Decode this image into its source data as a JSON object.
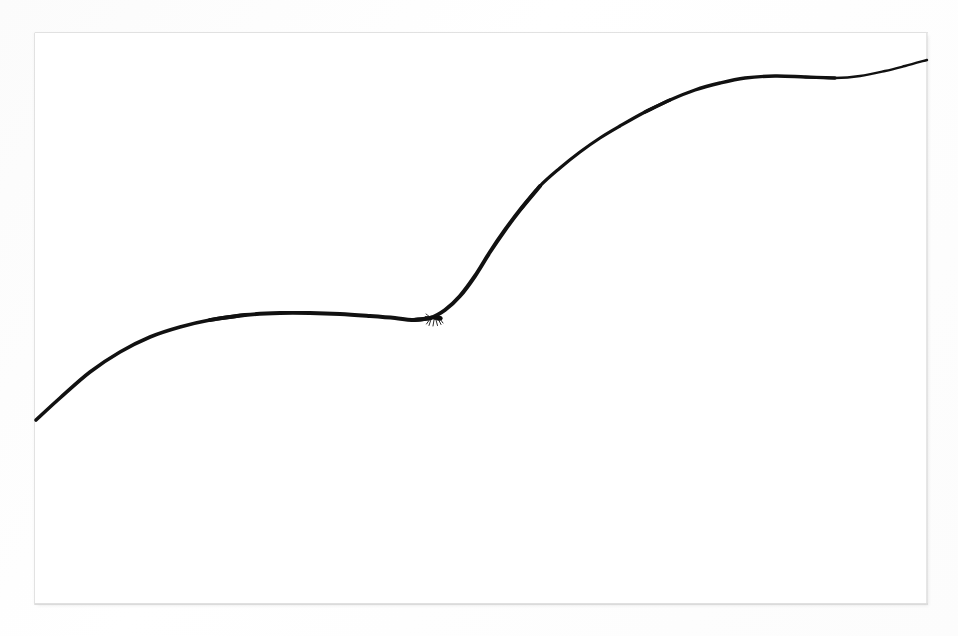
{
  "scene": {
    "title": "Hand-drawn double sigmoid curve on white paper",
    "medium": "black ink line on white paper sheet",
    "canvas": {
      "width": 958,
      "height": 636
    },
    "background_color": "#fdfdfd",
    "paper": {
      "label": "white paper sheet",
      "left": 35,
      "top": 33,
      "width": 892,
      "height": 571,
      "color": "#ffffff",
      "edge_color": "#dedede"
    },
    "ink_color": "#111111"
  },
  "chart_data": {
    "type": "line",
    "title": "",
    "subtitle": "",
    "xlabel": "",
    "ylabel": "",
    "grid": false,
    "legend": "none",
    "axis_visible": false,
    "tick_labels_x": [],
    "tick_labels_y": [],
    "xlim": [
      35,
      927
    ],
    "ylim": [
      604,
      33
    ],
    "series": [
      {
        "name": "hand-drawn curve",
        "color": "#111111",
        "stroke_width_min": 1.8,
        "stroke_width_max": 4.2,
        "x": [
          36,
          60,
          90,
          120,
          150,
          180,
          210,
          245,
          280,
          310,
          340,
          370,
          395,
          412,
          430,
          445,
          460,
          475,
          490,
          505,
          520,
          540,
          560,
          580,
          600,
          620,
          645,
          670,
          695,
          720,
          745,
          775,
          805,
          835,
          860,
          885,
          905,
          927
        ],
        "y": [
          420,
          398,
          372,
          352,
          337,
          327,
          320,
          315,
          313,
          313,
          314,
          316,
          318,
          320,
          318,
          310,
          296,
          276,
          252,
          230,
          210,
          186,
          168,
          152,
          138,
          126,
          112,
          100,
          90,
          83,
          78,
          76,
          77,
          78,
          76,
          71,
          66,
          60
        ]
      }
    ],
    "annotations": [
      {
        "name": "ant",
        "label": "small black ant standing on the curve",
        "x": 435,
        "y": 318,
        "size_px": 16
      }
    ]
  }
}
